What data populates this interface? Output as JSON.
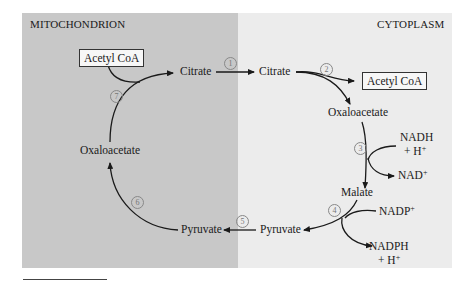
{
  "regions": {
    "left": "MITOCHONDRION",
    "right": "CYTOPLASM"
  },
  "compartment_colors": {
    "mitochondrion": "#c8c8c8",
    "cytoplasm": "#ececec"
  },
  "nodes": {
    "mito_acetyl_coa": "Acetyl CoA",
    "mito_citrate": "Citrate",
    "mito_oxaloacetate": "Oxaloacetate",
    "mito_pyruvate": "Pyruvate",
    "cyto_citrate": "Citrate",
    "cyto_acetyl_coa": "Acetyl CoA",
    "cyto_oxaloacetate": "Oxaloacetate",
    "cyto_malate": "Malate",
    "cyto_pyruvate": "Pyruvate"
  },
  "cofactors": {
    "nadh_1": "NADH",
    "nadh_2": "+ H",
    "nad": "NAD",
    "nadp": "NADP",
    "nadph_1": "NADPH",
    "nadph_2": "+ H",
    "plus": "+"
  },
  "steps": [
    "1",
    "2",
    "3",
    "4",
    "5",
    "6",
    "7"
  ]
}
